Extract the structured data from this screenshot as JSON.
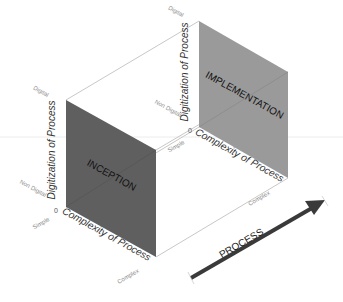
{
  "diagram": {
    "faces": {
      "front": {
        "label": "INCEPTION",
        "color": "#5f5f5f"
      },
      "back": {
        "label": "IMPLEMENTATION",
        "color": "#9a9a9a"
      }
    },
    "front_axes": {
      "vertical_title": "Digitization of Process",
      "vertical_top": "Digital",
      "vertical_mid": "Non Digital",
      "origin": "0",
      "horizontal_title": "Complexity of Process",
      "horizontal_start": "Simple",
      "horizontal_end": "Complex"
    },
    "back_axes": {
      "vertical_title": "Digitization of Process",
      "vertical_top": "Digital",
      "vertical_mid": "Non Digital",
      "origin": "0",
      "horizontal_title": "Complexity of Process",
      "horizontal_start": "Simple",
      "horizontal_end": "Complex"
    },
    "arrow": {
      "label": "PROCESS",
      "color": "#3a3a3a"
    },
    "edge_color": "#c8c8c8",
    "label_color": "#333333",
    "tick_color": "#8a8a8a"
  }
}
